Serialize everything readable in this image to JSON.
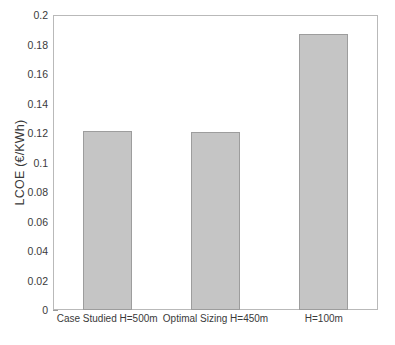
{
  "chart_data": {
    "type": "bar",
    "title": "",
    "xlabel": "",
    "ylabel": "LCOE (€/KWh)",
    "categories": [
      "Case Studied H=500m",
      "Optimal Sizing H=450m",
      "H=100m"
    ],
    "values": [
      0.1215,
      0.121,
      0.1872
    ],
    "ylim": [
      0,
      0.2
    ],
    "ytick_values": [
      0,
      0.02,
      0.04,
      0.06,
      0.08,
      0.1,
      0.12,
      0.14,
      0.16,
      0.18,
      0.2
    ],
    "ytick_labels": [
      "0",
      "0.02",
      "0.04",
      "0.06",
      "0.08",
      "0.1",
      "0.12",
      "0.14",
      "0.16",
      "0.18",
      "0.2"
    ],
    "grid": false,
    "legend": null,
    "bar_color": "#c5c5c5",
    "bar_edge_color": "#9d9d9d",
    "axes_color": "#b9b9b9",
    "background_color": "#ffffff",
    "bar_centers_fraction": [
      0.1666,
      0.5,
      0.8333
    ],
    "bar_width_fraction": 0.151
  }
}
